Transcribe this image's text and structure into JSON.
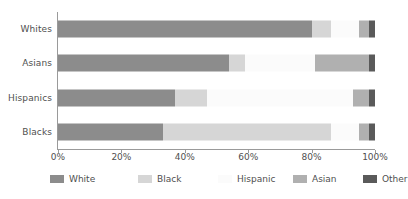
{
  "chart_data": {
    "type": "bar",
    "orientation": "horizontal",
    "stacked": true,
    "normalized": true,
    "title": "",
    "subtitle": "",
    "xlabel": "",
    "ylabel": "",
    "xlim": [
      0,
      100
    ],
    "grid": false,
    "legend_position": "bottom",
    "categories": [
      "Whites",
      "Asians",
      "Hispanics",
      "Blacks"
    ],
    "tick_labels": [
      "0%",
      "20%",
      "40%",
      "60%",
      "80%",
      "100%"
    ],
    "tick_values": [
      0,
      20,
      40,
      60,
      80,
      100
    ],
    "series": [
      {
        "name": "White",
        "color": "#8c8c8c",
        "values": [
          80,
          54,
          37,
          33
        ]
      },
      {
        "name": "Black",
        "color": "#d6d6d6",
        "values": [
          6,
          5,
          10,
          53
        ]
      },
      {
        "name": "Hispanic",
        "color": "#fbfbfb",
        "values": [
          9,
          22,
          46,
          9
        ]
      },
      {
        "name": "Asian",
        "color": "#b0b0b0",
        "values": [
          3,
          17,
          5,
          3
        ]
      },
      {
        "name": "Other",
        "color": "#5a5a5a",
        "values": [
          2,
          2,
          2,
          2
        ]
      }
    ]
  },
  "legend": {
    "items": [
      {
        "label": "White"
      },
      {
        "label": "Black"
      },
      {
        "label": "Hispanic"
      },
      {
        "label": "Asian"
      },
      {
        "label": "Other"
      }
    ]
  }
}
